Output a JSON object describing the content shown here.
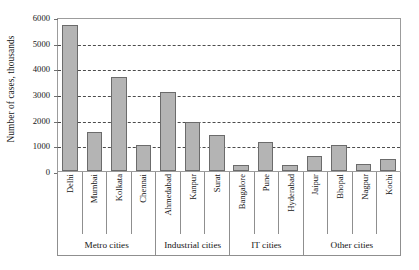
{
  "chart_data": {
    "type": "bar",
    "title": "",
    "xlabel": "",
    "ylabel": "Number of cases, thousands",
    "ylim": [
      0,
      6000
    ],
    "ytick_step": 1000,
    "yticks": [
      0,
      1000,
      2000,
      3000,
      4000,
      5000,
      6000
    ],
    "ytick_labels": [
      "0",
      "1000",
      "2000",
      "3000",
      "4000",
      "5000",
      "6000"
    ],
    "grid": "horizontal-dashed",
    "legend": "none",
    "bar_color": "#b4b4b4",
    "bar_edge_color": "#6b6b6b",
    "axis_color": "#9c9c9c",
    "categories": [
      "Delhi",
      "Mumbai",
      "Kolkata",
      "Chennai",
      "Ahmedabad",
      "Kanpur",
      "Surat",
      "Bangalore",
      "Pune",
      "Hyderabad",
      "Jaipur",
      "Bhopal",
      "Nagpur",
      "Kochi"
    ],
    "values": [
      5700,
      1530,
      3680,
      1000,
      3060,
      1900,
      1400,
      230,
      1120,
      250,
      570,
      1010,
      290,
      450
    ],
    "groups": [
      {
        "label": "Metro cities",
        "count": 4
      },
      {
        "label": "Industrial cities",
        "count": 3
      },
      {
        "label": "IT cities",
        "count": 3
      },
      {
        "label": "Other cities",
        "count": 4
      }
    ]
  }
}
